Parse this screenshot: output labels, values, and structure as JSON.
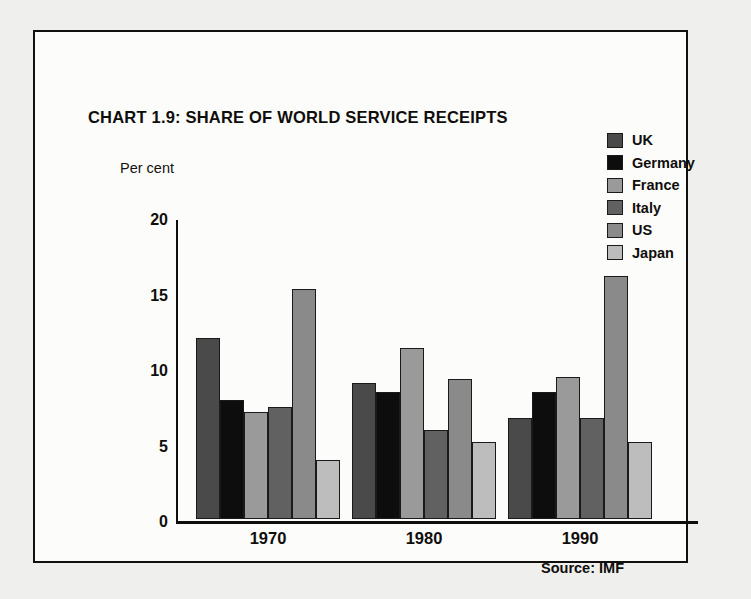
{
  "chart_data": {
    "type": "bar",
    "title": "CHART 1.9: SHARE OF WORLD SERVICE RECEIPTS",
    "xlabel": "",
    "ylabel": "Per cent",
    "categories": [
      "1970",
      "1980",
      "1990"
    ],
    "ylim": [
      0,
      20
    ],
    "yticks": [
      0,
      5,
      10,
      15,
      20
    ],
    "ytick_labels": [
      "0",
      "5",
      "10",
      "15",
      "20"
    ],
    "grid": false,
    "legend_position": "top-right",
    "source": "Source: IMF",
    "series": [
      {
        "name": "UK",
        "color": "#4a4a4a",
        "values": [
          12.0,
          9.0,
          6.7
        ]
      },
      {
        "name": "Germany",
        "color": "#0d0d0d",
        "values": [
          7.9,
          8.4,
          8.4
        ]
      },
      {
        "name": "France",
        "color": "#9a9a9a",
        "values": [
          7.1,
          11.3,
          9.4
        ]
      },
      {
        "name": "Italy",
        "color": "#616161",
        "values": [
          7.4,
          5.9,
          6.7
        ]
      },
      {
        "name": "US",
        "color": "#8a8a8a",
        "values": [
          15.2,
          9.3,
          16.1
        ]
      },
      {
        "name": "Japan",
        "color": "#bdbdbd",
        "values": [
          3.9,
          5.1,
          5.1
        ]
      }
    ]
  }
}
